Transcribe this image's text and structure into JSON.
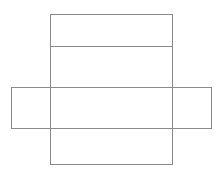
{
  "page": {
    "background_color": "#ffffff",
    "width": 222,
    "height": 172
  },
  "diagram": {
    "name": "box-net-outline",
    "stroke_color": "#8a8a8a",
    "stroke_width": 1,
    "fill": "none",
    "shapes": [
      {
        "id": "vertical-rect",
        "label": "tall vertical rectangle",
        "type": "rect",
        "x": 50,
        "y": 14,
        "width": 122,
        "height": 150
      },
      {
        "id": "horizontal-rect",
        "label": "wide horizontal rectangle",
        "type": "rect",
        "x": 11,
        "y": 87,
        "width": 200,
        "height": 41
      },
      {
        "id": "top-divider",
        "label": "horizontal divider line",
        "type": "line",
        "x1": 50,
        "y1": 46,
        "x2": 172,
        "y2": 46
      }
    ]
  }
}
